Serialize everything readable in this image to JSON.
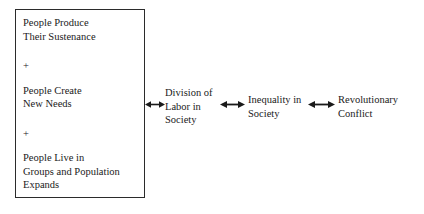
{
  "diagram": {
    "cause_box": {
      "items": [
        {
          "id": "sustenance",
          "lines": [
            "People Produce",
            "Their Sustenance"
          ]
        },
        {
          "id": "needs",
          "lines": [
            "People Create",
            "New Needs"
          ]
        },
        {
          "id": "population",
          "lines": [
            "People Live in",
            "Groups and Population",
            "Expands"
          ]
        }
      ],
      "connector_1": "+",
      "connector_2": "+"
    },
    "stages": [
      {
        "id": "division",
        "lines": [
          "Division of",
          "Labor in",
          "Society"
        ]
      },
      {
        "id": "inequality",
        "lines": [
          "Inequality in",
          "Society"
        ]
      },
      {
        "id": "revolution",
        "lines": [
          "Revolutionary",
          "Conflict"
        ]
      }
    ],
    "arrows": [
      {
        "id": "arrow-1",
        "kind": "double-headed-arrow",
        "from": "cause-box",
        "to": "division"
      },
      {
        "id": "arrow-2",
        "kind": "double-headed-arrow",
        "from": "division",
        "to": "inequality"
      },
      {
        "id": "arrow-3",
        "kind": "double-headed-arrow",
        "from": "inequality",
        "to": "revolution"
      }
    ],
    "colors": {
      "ink": "#1a1a1a",
      "border": "#2b2b2b",
      "background": "#ffffff"
    }
  }
}
